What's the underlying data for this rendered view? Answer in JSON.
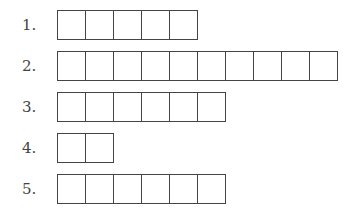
{
  "rows": [
    {
      "label": "1.",
      "boxes": 5
    },
    {
      "label": "2.",
      "boxes": 10
    },
    {
      "label": "3.",
      "boxes": 6
    },
    {
      "label": "4.",
      "boxes": 2
    },
    {
      "label": "5.",
      "boxes": 6
    }
  ]
}
